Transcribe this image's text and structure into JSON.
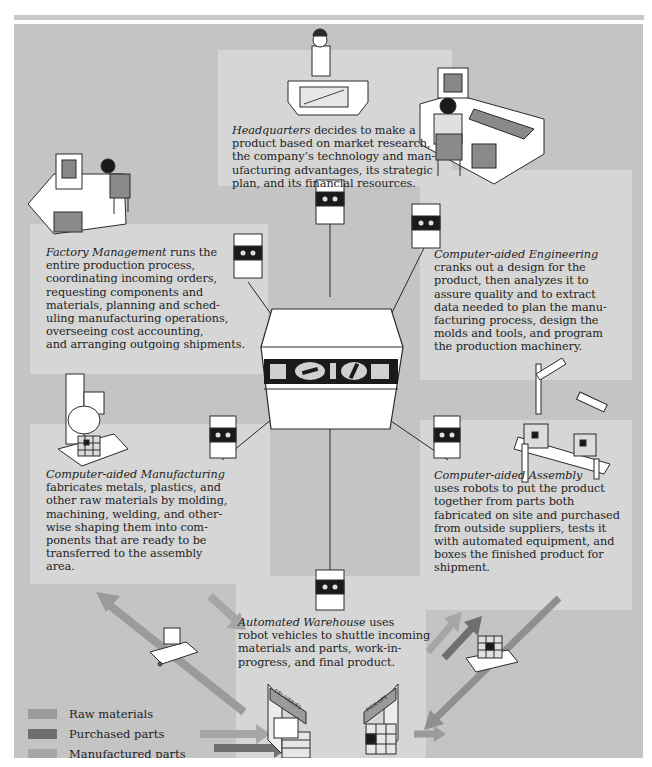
{
  "diagram": {
    "nodes": [
      {
        "id": "headquarters",
        "title": "Headquarters",
        "body": " decides to make a product based on market research, the company’s technology and manufacturing advantages, its strategic plan, and its financial resources.",
        "lines": [
          "decides to make a",
          "product based on market research,",
          "the company’s technology and man-",
          "ufacturing advantages, its strategic",
          "plan, and its financial resources."
        ]
      },
      {
        "id": "factory-management",
        "title": "Factory Management",
        "body": " runs the entire production process, coordinating incoming orders, requesting components and materials, planning and scheduling manufacturing operations, overseeing cost accounting, and arranging outgoing shipments.",
        "lines": [
          "runs the",
          "entire production process,",
          "coordinating incoming orders,",
          "requesting components and",
          "materials, planning and sched-",
          "uling manufacturing operations,",
          "overseeing cost accounting,",
          "and arranging outgoing shipments."
        ]
      },
      {
        "id": "computer-aided-engineering",
        "title": "Computer-aided Engineering",
        "body": "cranks out a design for the product, then analyzes it to assure quality and to extract data needed to plan the manufacturing process, design the molds and tools, and program the production machinery.",
        "lines": [
          "cranks out a design for the",
          "product, then analyzes it to",
          "assure quality and to extract",
          "data needed to plan the manu-",
          "facturing process, design the",
          "molds and tools, and program",
          "the production machinery."
        ]
      },
      {
        "id": "computer-aided-manufacturing",
        "title": "Computer-aided Manufacturing",
        "body": "fabricates metals, plastics, and other raw materials by molding, machining, welding, and otherwise shaping them into components that are ready to be transferred to the assembly area.",
        "lines": [
          "fabricates metals, plastics, and",
          "other raw materials by molding,",
          "machining, welding, and other-",
          "wise shaping them into com-",
          "ponents that are ready to be",
          "transferred to the assembly",
          "area."
        ]
      },
      {
        "id": "computer-aided-assembly",
        "title": "Computer-aided Assembly",
        "body": "uses robots to put the product together from parts both fabricated on site and purchased from outside suppliers, tests it with automated equipment, and boxes the finished product for shipment.",
        "lines": [
          "uses robots to put the product",
          "together from parts both",
          "fabricated on site and purchased",
          "from outside suppliers, tests it",
          "with automated equipment, and",
          "boxes the finished product for",
          "shipment."
        ]
      },
      {
        "id": "automated-warehouse",
        "title": "Automated Warehouse",
        "body": " uses robot vehicles to shuttle incoming materials and parts, work-in-progress, and final product.",
        "lines": [
          "uses",
          "robot vehicles to shuttle incoming",
          "materials and parts, work-in-",
          "progress, and final product."
        ]
      }
    ],
    "warehouse_signs": [
      "DELIVERIES",
      "PICK-UPS"
    ]
  },
  "legend": {
    "items": [
      {
        "label": "Raw materials",
        "color": "#9b9b9b"
      },
      {
        "label": "Purchased parts",
        "color": "#6f6f6f"
      },
      {
        "label": "Manufactured parts",
        "color": "#a6a6a6"
      },
      {
        "label": "Finished product",
        "color": "#8f8f8f"
      }
    ]
  },
  "colors": {
    "background": "#c4c4c4",
    "text_panel": "#d6d6d6",
    "arrow_raw": "#9b9b9b",
    "arrow_purchased": "#6f6f6f",
    "arrow_manufactured": "#a6a6a6",
    "arrow_finished": "#8f8f8f"
  }
}
